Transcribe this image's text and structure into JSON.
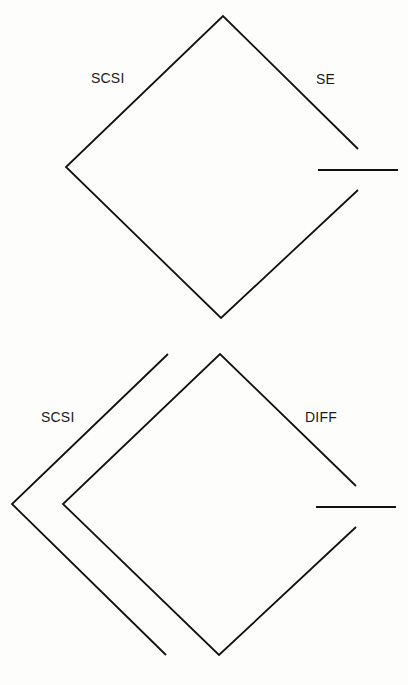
{
  "diagrams": [
    {
      "id": "single-ended",
      "labels": {
        "left": "SCSI",
        "right": "SE"
      }
    },
    {
      "id": "differential",
      "labels": {
        "left": "SCSI",
        "right": "DIFF"
      }
    }
  ],
  "colors": {
    "stroke": "#111111",
    "background": "#fdfdfb",
    "text": "#1a1a1a"
  }
}
